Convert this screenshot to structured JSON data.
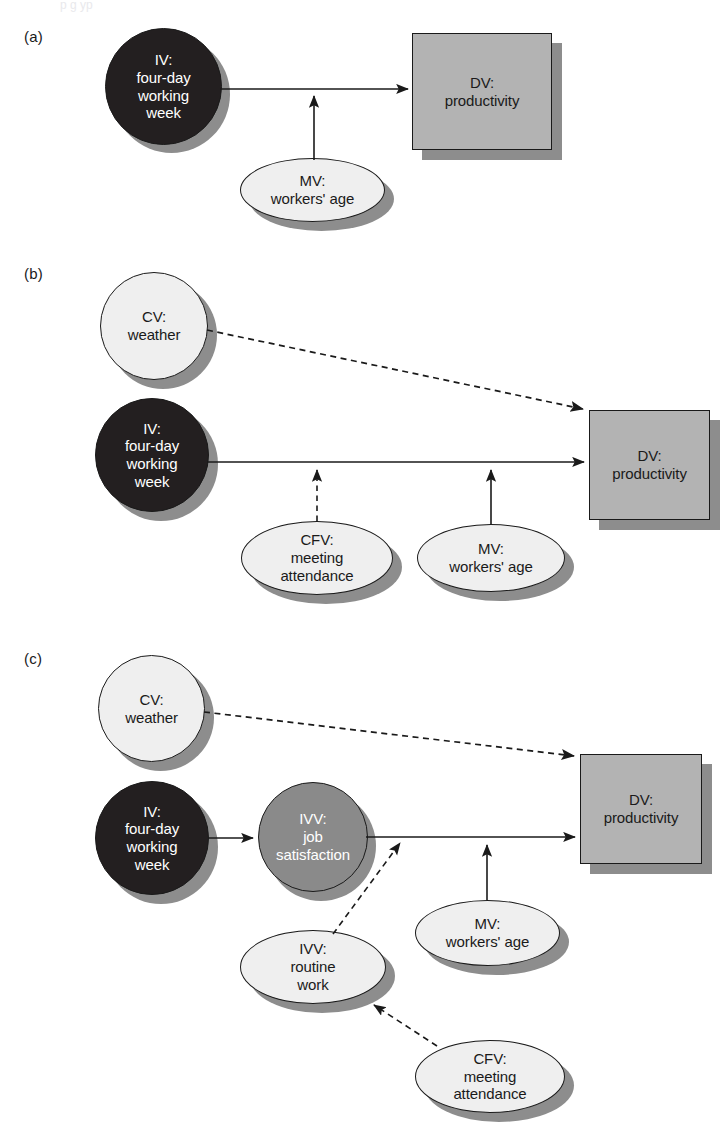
{
  "figure": {
    "top_cut_text": "p          g  yp",
    "panels": [
      {
        "key": "a",
        "label": "(a)"
      },
      {
        "key": "b",
        "label": "(b)"
      },
      {
        "key": "c",
        "label": "(c)"
      }
    ]
  },
  "colors": {
    "iv_fill": "#231f20",
    "ivv_fill": "#8a8a8a",
    "light_fill": "#efefef",
    "dv_fill": "#b3b3b3",
    "outline": "#1a1a1a",
    "shadow": "#8d8d8d",
    "page_bg": "#ffffff"
  },
  "panel_a": {
    "label": "(a)",
    "nodes": {
      "iv": {
        "name": "IV:\nfour-day\nworking\nweek",
        "shape": "circle",
        "fill": "iv_fill"
      },
      "dv": {
        "name": "DV:\nproductivity",
        "shape": "rect",
        "fill": "dv_fill"
      },
      "mv": {
        "name": "MV:\nworkers' age",
        "shape": "ellipse",
        "fill": "light_fill"
      }
    },
    "edges": [
      {
        "from": "iv",
        "to": "dv",
        "style": "solid",
        "arrow": "end"
      },
      {
        "from": "mv",
        "to": "iv-dv-path",
        "style": "solid",
        "arrow": "end"
      }
    ]
  },
  "panel_b": {
    "label": "(b)",
    "nodes": {
      "cv": {
        "name": "CV:\nweather",
        "shape": "circle",
        "fill": "light_fill"
      },
      "iv": {
        "name": "IV:\nfour-day\nworking\nweek",
        "shape": "circle",
        "fill": "iv_fill"
      },
      "dv": {
        "name": "DV:\nproductivity",
        "shape": "rect",
        "fill": "dv_fill"
      },
      "cfv": {
        "name": "CFV:\nmeeting\nattendance",
        "shape": "ellipse",
        "fill": "light_fill"
      },
      "mv": {
        "name": "MV:\nworkers' age",
        "shape": "ellipse",
        "fill": "light_fill"
      }
    },
    "edges": [
      {
        "from": "cv",
        "to": "dv",
        "style": "dashed",
        "arrow": "end"
      },
      {
        "from": "iv",
        "to": "dv",
        "style": "solid",
        "arrow": "end"
      },
      {
        "from": "cfv",
        "to": "iv-dv-path",
        "style": "dashed",
        "arrow": "end"
      },
      {
        "from": "mv",
        "to": "iv-dv-path",
        "style": "solid",
        "arrow": "end"
      }
    ]
  },
  "panel_c": {
    "label": "(c)",
    "nodes": {
      "cv": {
        "name": "CV:\nweather",
        "shape": "circle",
        "fill": "light_fill"
      },
      "iv": {
        "name": "IV:\nfour-day\nworking\nweek",
        "shape": "circle",
        "fill": "iv_fill"
      },
      "ivv_job": {
        "name": "IVV:\njob\nsatisfaction",
        "shape": "circle",
        "fill": "ivv_fill"
      },
      "dv": {
        "name": "DV:\nproductivity",
        "shape": "rect",
        "fill": "dv_fill"
      },
      "ivv_routine": {
        "name": "IVV:\nroutine\nwork",
        "shape": "ellipse",
        "fill": "light_fill"
      },
      "mv": {
        "name": "MV:\nworkers' age",
        "shape": "ellipse",
        "fill": "light_fill"
      },
      "cfv": {
        "name": "CFV:\nmeeting\nattendance",
        "shape": "ellipse",
        "fill": "light_fill"
      }
    },
    "edges": [
      {
        "from": "cv",
        "to": "dv",
        "style": "dashed",
        "arrow": "end"
      },
      {
        "from": "iv",
        "to": "ivv_job",
        "style": "solid",
        "arrow": "end"
      },
      {
        "from": "ivv_job",
        "to": "dv",
        "style": "solid",
        "arrow": "end"
      },
      {
        "from": "ivv_routine",
        "to": "ivv_job-dv-path",
        "style": "dashed",
        "arrow": "end"
      },
      {
        "from": "mv",
        "to": "ivv_job-dv-path",
        "style": "solid",
        "arrow": "end"
      },
      {
        "from": "cfv",
        "to": "ivv_routine",
        "style": "dashed",
        "arrow": "end"
      }
    ]
  }
}
